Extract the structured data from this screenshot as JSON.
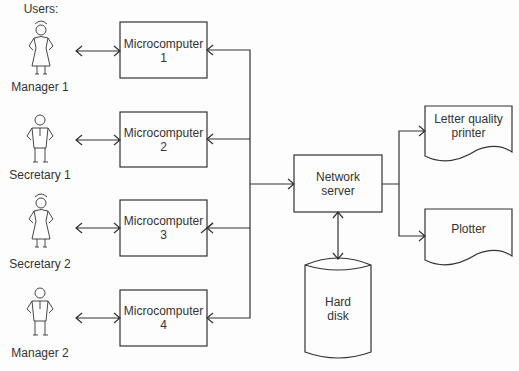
{
  "users_label": "Users:",
  "users": [
    {
      "label": "Manager 1",
      "figure": "woman"
    },
    {
      "label": "Secretary 1",
      "figure": "man"
    },
    {
      "label": "Secretary 2",
      "figure": "woman"
    },
    {
      "label": "Manager 2",
      "figure": "man"
    }
  ],
  "microcomputers": [
    {
      "line1": "Microcomputer",
      "line2": "1"
    },
    {
      "line1": "Microcomputer",
      "line2": "2"
    },
    {
      "line1": "Microcomputer",
      "line2": "3"
    },
    {
      "line1": "Microcomputer",
      "line2": "4"
    }
  ],
  "server": {
    "line1": "Network",
    "line2": "server"
  },
  "storage": {
    "line1": "Hard",
    "line2": "disk"
  },
  "outputs": [
    {
      "line1": "Letter quality",
      "line2": "printer"
    },
    {
      "line1": "Plotter",
      "line2": ""
    }
  ]
}
